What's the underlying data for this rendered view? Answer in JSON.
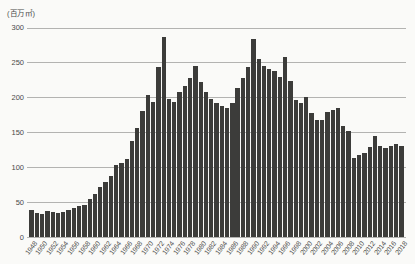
{
  "chart": {
    "background": "#fafaf8",
    "bar_color": "#3c3c3a",
    "grid_color": "#b3b3b1",
    "text_color": "#4a4a48"
  },
  "chart_data": {
    "type": "bar",
    "title": "",
    "xlabel": "",
    "ylabel": "(百万㎡)",
    "ylim": [
      0,
      300
    ],
    "yticks": [
      0,
      50,
      100,
      150,
      200,
      250,
      300
    ],
    "grid": "horizontal-only",
    "legend": "none",
    "xtick_label_step": 2,
    "categories": [
      1948,
      1949,
      1950,
      1951,
      1952,
      1953,
      1954,
      1955,
      1956,
      1957,
      1958,
      1959,
      1960,
      1961,
      1962,
      1963,
      1964,
      1965,
      1966,
      1967,
      1968,
      1969,
      1970,
      1971,
      1972,
      1973,
      1974,
      1975,
      1976,
      1977,
      1978,
      1979,
      1980,
      1981,
      1982,
      1983,
      1984,
      1985,
      1986,
      1987,
      1988,
      1989,
      1990,
      1991,
      1992,
      1993,
      1994,
      1995,
      1996,
      1997,
      1998,
      1999,
      2000,
      2001,
      2002,
      2003,
      2004,
      2005,
      2006,
      2007,
      2008,
      2009,
      2010,
      2011,
      2012,
      2013,
      2014,
      2015,
      2016,
      2017,
      2018
    ],
    "values": [
      39,
      35,
      33,
      37,
      36,
      35,
      36,
      38,
      41,
      44,
      46,
      54,
      62,
      72,
      79,
      87,
      103,
      106,
      112,
      137,
      156,
      181,
      203,
      194,
      244,
      287,
      197,
      194,
      208,
      216,
      228,
      245,
      222,
      208,
      198,
      192,
      187,
      185,
      192,
      214,
      228,
      243,
      283,
      255,
      245,
      240,
      237,
      229,
      258,
      224,
      196,
      192,
      201,
      178,
      168,
      168,
      179,
      182,
      185,
      159,
      152,
      113,
      118,
      120,
      129,
      145,
      131,
      128,
      131,
      133,
      130
    ]
  }
}
